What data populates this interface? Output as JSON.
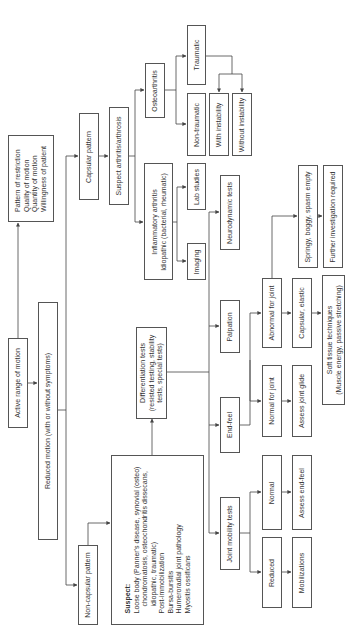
{
  "diagram": {
    "orientation": "rotated-90-ccw",
    "nodes": {
      "active_rom": "Active range of motion",
      "pattern": [
        "Pattern of restriction",
        "Quality of motion",
        "Quantity of motion",
        "Willingness of patient"
      ],
      "reduced_motion": "Reduced motion (with or without symptoms)",
      "capsular_pattern": "Capsular pattern",
      "suspect_arthritis": "Suspect arthritis/arthrosis",
      "osteoarthritis": "Osteoarthritis",
      "traumatic": "Traumatic",
      "non_traumatic": "Non-traumatic",
      "with_instability": "With instability",
      "without_instability": "Without instability",
      "inflammatory": [
        "Inflammatory arthritis",
        "Idiopathic (bacterial, rheumatic)"
      ],
      "lab_studies": "Lab studies",
      "imaging": "Imaging",
      "non_capsular_pattern": "Non-capsular pattern",
      "suspect": {
        "heading": "Suspect:",
        "lines": [
          "Loose body (Panner's disease, synovial (osteo)",
          "chondromatosis, osteochondritis dissecans,",
          "idiopathic, traumatic)",
          "Post-immobilization",
          "Bursa-bursitis",
          "Humeroradial joint pathology",
          "Myositis ossificans"
        ]
      },
      "differentiation": [
        "Differentiation tests",
        "(resisted testing, stability",
        "tests, special tests)"
      ],
      "neurodynamic": "Neurodynamic tests",
      "palpation": "Palpation",
      "end_feel": "End-feel",
      "joint_mobility": "Joint mobility tests",
      "abnormal_joint": "Abnormal for joint",
      "normal_joint": "Normal for joint",
      "springy": "Springy, boggy, spasm empty",
      "further_investigation": "Further investigation required",
      "capsular_elastic": "Capsular, elastic",
      "assess_glide": "Assess joint glide",
      "soft_tissue": [
        "Soft tissue techniques",
        "(Muscle energy, passive stretching)"
      ],
      "normal": "Normal",
      "assess_end_feel": "Assess end-feel",
      "reduced": "Reduced",
      "mobilizations": "Mobilizations"
    },
    "colors": {
      "line": "#444444",
      "border": "#555555",
      "text": "#333333",
      "background": "#ffffff"
    }
  }
}
